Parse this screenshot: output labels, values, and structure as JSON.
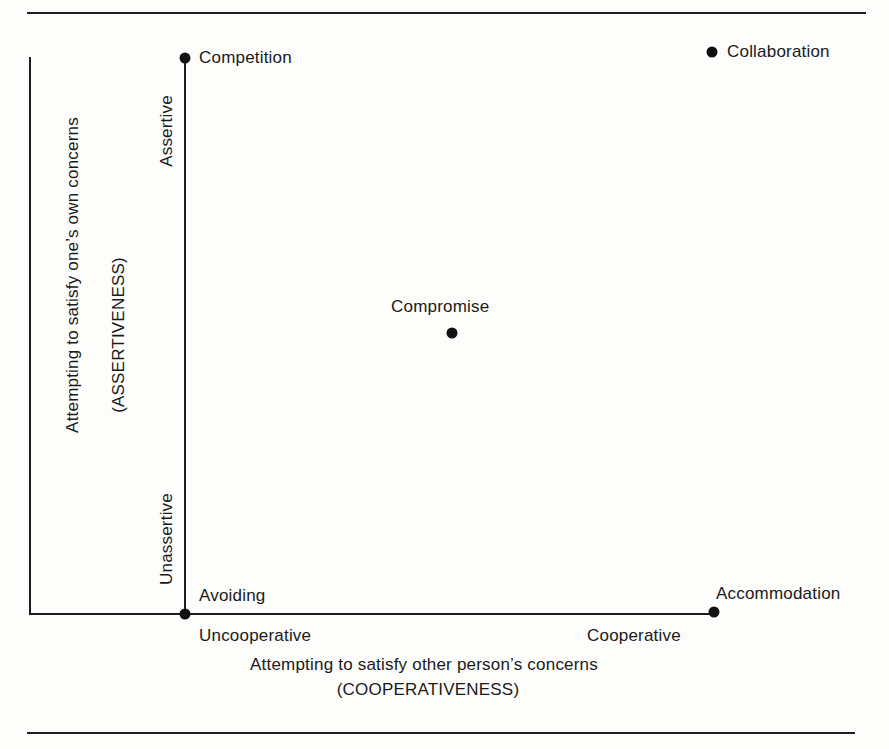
{
  "diagram": {
    "type": "conflict-mode-grid",
    "y_axis": {
      "title": "Attempting to satisfy one’s own concerns",
      "subtitle": "(ASSERTIVENESS)",
      "high_label": "Assertive",
      "low_label": "Unassertive"
    },
    "x_axis": {
      "title": "Attempting to satisfy other person’s concerns",
      "subtitle": "(COOPERATIVENESS)",
      "low_label": "Uncooperative",
      "high_label": "Cooperative"
    },
    "modes": [
      {
        "label": "Competition",
        "assertiveness": "high",
        "cooperativeness": "low"
      },
      {
        "label": "Collaboration",
        "assertiveness": "high",
        "cooperativeness": "high"
      },
      {
        "label": "Compromise",
        "assertiveness": "medium",
        "cooperativeness": "medium"
      },
      {
        "label": "Avoiding",
        "assertiveness": "low",
        "cooperativeness": "low"
      },
      {
        "label": "Accommodation",
        "assertiveness": "low",
        "cooperativeness": "high"
      }
    ],
    "colors": {
      "ink": "#1a1a1a",
      "background": "#fdfdfc"
    }
  }
}
